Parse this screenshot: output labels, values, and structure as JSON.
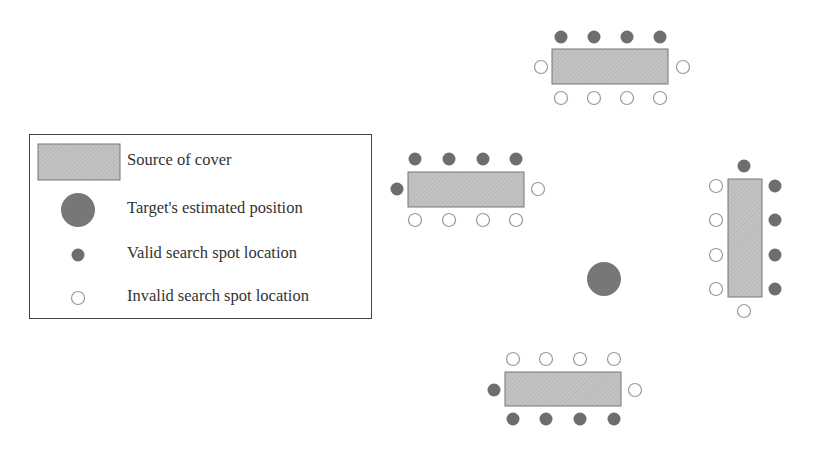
{
  "legend": {
    "items": [
      {
        "symbol": "cover-rectangle",
        "label": "Source of cover"
      },
      {
        "symbol": "large-filled-circle",
        "label": "Target's estimated position"
      },
      {
        "symbol": "small-filled-circle",
        "label": "Valid search spot location"
      },
      {
        "symbol": "small-open-circle",
        "label": "Invalid search spot location"
      }
    ]
  },
  "colors": {
    "cover_fill": "#bdbdbd",
    "cover_stroke": "#777777",
    "valid": "#6e6e6e",
    "invalid_stroke": "#9a9a9a",
    "target": "#777777",
    "border": "#444444"
  },
  "target": {
    "x": 604,
    "y": 279,
    "r": 17
  },
  "covers": [
    {
      "id": "top",
      "x": 552,
      "y": 49,
      "w": 116,
      "h": 35
    },
    {
      "id": "left-middle",
      "x": 408,
      "y": 172,
      "w": 116,
      "h": 35
    },
    {
      "id": "right",
      "x": 728,
      "y": 179,
      "w": 34,
      "h": 118
    },
    {
      "id": "bottom",
      "x": 505,
      "y": 372,
      "w": 116,
      "h": 34
    }
  ],
  "spots": {
    "valid": [
      [
        561,
        37
      ],
      [
        594,
        37
      ],
      [
        627,
        37
      ],
      [
        660,
        37
      ],
      [
        415,
        159
      ],
      [
        449,
        159
      ],
      [
        483,
        159
      ],
      [
        516,
        159
      ],
      [
        397,
        189
      ],
      [
        744,
        166
      ],
      [
        775,
        186
      ],
      [
        775,
        220
      ],
      [
        775,
        255
      ],
      [
        775,
        289
      ],
      [
        494,
        390
      ],
      [
        513,
        419
      ],
      [
        546,
        419
      ],
      [
        580,
        419
      ],
      [
        614,
        419
      ]
    ],
    "invalid": [
      [
        541,
        67
      ],
      [
        683,
        67
      ],
      [
        561,
        98
      ],
      [
        594,
        98
      ],
      [
        627,
        98
      ],
      [
        660,
        98
      ],
      [
        538,
        189
      ],
      [
        415,
        220
      ],
      [
        449,
        220
      ],
      [
        483,
        220
      ],
      [
        516,
        220
      ],
      [
        716,
        186
      ],
      [
        716,
        220
      ],
      [
        716,
        255
      ],
      [
        716,
        289
      ],
      [
        744,
        311
      ],
      [
        513,
        359
      ],
      [
        546,
        359
      ],
      [
        580,
        359
      ],
      [
        614,
        359
      ],
      [
        635,
        390
      ]
    ]
  }
}
